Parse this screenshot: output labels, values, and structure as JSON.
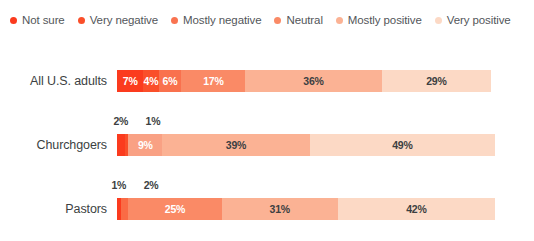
{
  "legend": {
    "items": [
      {
        "label": "Not sure",
        "color": "#fb3b1e"
      },
      {
        "label": "Very negative",
        "color": "#fa4f2a"
      },
      {
        "label": "Mostly negative",
        "color": "#f97350"
      },
      {
        "label": "Neutral",
        "color": "#fa8a66"
      },
      {
        "label": "Mostly positive",
        "color": "#fbb294"
      },
      {
        "label": "Very positive",
        "color": "#fcd9c5"
      }
    ]
  },
  "chart_data": {
    "type": "bar",
    "title": "",
    "xlabel": "",
    "ylabel": "",
    "stacked": true,
    "orientation": "horizontal",
    "xlim": [
      0,
      100
    ],
    "grid": false,
    "legend_position": "top-left",
    "categories": [
      "All U.S. adults",
      "Churchgoers",
      "Pastors"
    ],
    "series": [
      {
        "name": "Not sure",
        "color": "#fb3b1e",
        "values": [
          7,
          2,
          1
        ]
      },
      {
        "name": "Very negative",
        "color": "#fa4f2a",
        "values": [
          4,
          1,
          2
        ]
      },
      {
        "name": "Mostly negative",
        "color": "#f97350",
        "values": [
          6,
          9,
          25
        ]
      },
      {
        "name": "Neutral",
        "color": "#fa8a66",
        "values": [
          17,
          39,
          31
        ]
      },
      {
        "name": "Mostly positive",
        "color": "#fbb294",
        "values": [
          36,
          49,
          42
        ]
      },
      {
        "name": "Very positive",
        "color": "#fcd9c5",
        "values": [
          29,
          0,
          0
        ]
      }
    ]
  },
  "rows": [
    {
      "label": "All U.S. adults",
      "callouts": [],
      "segments": [
        {
          "value": 7,
          "label": "7%",
          "color": "#fb3b1e",
          "text_color": "#ffffff",
          "show_label": true
        },
        {
          "value": 4,
          "label": "4%",
          "color": "#fa4f2a",
          "text_color": "#ffffff",
          "show_label": true
        },
        {
          "value": 6,
          "label": "6%",
          "color": "#f9714e",
          "text_color": "#ffffff",
          "show_label": true
        },
        {
          "value": 17,
          "label": "17%",
          "color": "#fa8a66",
          "text_color": "#ffffff",
          "show_label": true
        },
        {
          "value": 36,
          "label": "36%",
          "color": "#fbb294",
          "text_color": "#3c3f42",
          "show_label": true
        },
        {
          "value": 29,
          "label": "29%",
          "color": "#fcd9c5",
          "text_color": "#3c3f42",
          "show_label": true
        }
      ]
    },
    {
      "label": "Churchgoers",
      "callouts": [
        {
          "label": "2%",
          "at_percent": 1.0
        },
        {
          "label": "1%",
          "at_percent": 9.5
        }
      ],
      "segments": [
        {
          "value": 2,
          "label": "2%",
          "color": "#fb3b1e",
          "text_color": "#ffffff",
          "show_label": false
        },
        {
          "value": 1,
          "label": "1%",
          "color": "#fa4f2a",
          "text_color": "#ffffff",
          "show_label": false
        },
        {
          "value": 9,
          "label": "9%",
          "color": "#f9a184",
          "text_color": "#ffffff",
          "show_label": true
        },
        {
          "value": 39,
          "label": "39%",
          "color": "#fbb294",
          "text_color": "#3c3f42",
          "show_label": true
        },
        {
          "value": 49,
          "label": "49%",
          "color": "#fcd9c5",
          "text_color": "#3c3f42",
          "show_label": true
        }
      ]
    },
    {
      "label": "Pastors",
      "callouts": [
        {
          "label": "1%",
          "at_percent": 0.5
        },
        {
          "label": "2%",
          "at_percent": 9.0
        }
      ],
      "segments": [
        {
          "value": 1,
          "label": "1%",
          "color": "#fb3b1e",
          "text_color": "#ffffff",
          "show_label": false
        },
        {
          "value": 2,
          "label": "2%",
          "color": "#fa6b45",
          "text_color": "#ffffff",
          "show_label": false
        },
        {
          "value": 25,
          "label": "25%",
          "color": "#fa8a66",
          "text_color": "#ffffff",
          "show_label": true
        },
        {
          "value": 31,
          "label": "31%",
          "color": "#fbb294",
          "text_color": "#3c3f42",
          "show_label": true
        },
        {
          "value": 42,
          "label": "42%",
          "color": "#fcd9c5",
          "text_color": "#3c3f42",
          "show_label": true
        }
      ]
    }
  ]
}
